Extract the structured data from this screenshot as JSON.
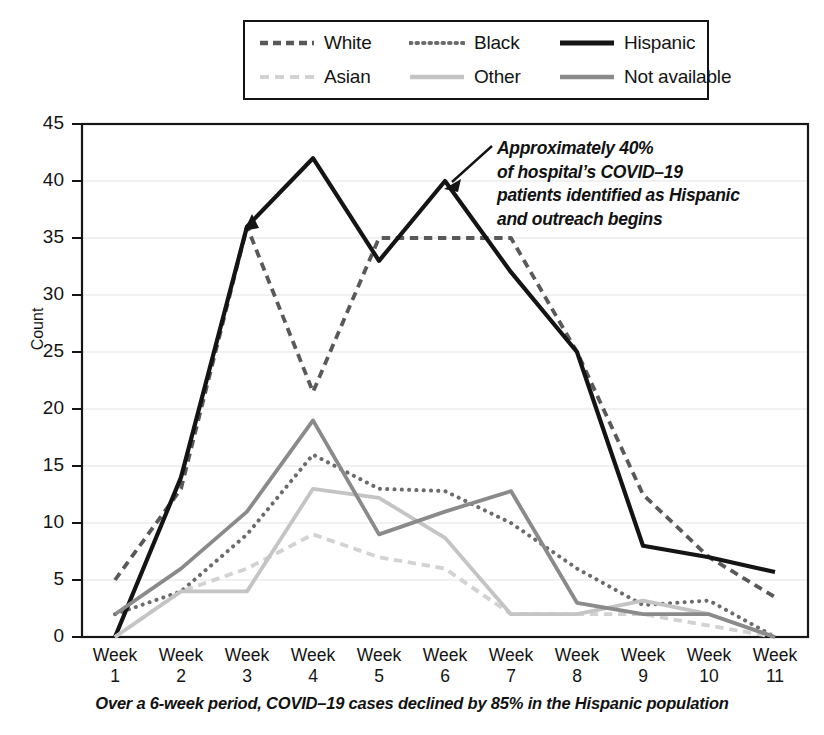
{
  "chart_data": {
    "type": "line",
    "title": "",
    "xlabel": "",
    "ylabel": "Count",
    "ylim": [
      0,
      45
    ],
    "yticks": [
      0,
      5,
      10,
      15,
      20,
      25,
      30,
      35,
      40,
      45
    ],
    "grid": true,
    "legend_position": "top",
    "categories": [
      "Week 1",
      "Week 2",
      "Week 3",
      "Week 4",
      "Week 5",
      "Week 6",
      "Week 7",
      "Week 8",
      "Week 9",
      "Week 10",
      "Week 11"
    ],
    "series": [
      {
        "name": "White",
        "style": "dashed",
        "color": "#595959",
        "values": [
          5,
          13,
          36,
          21.5,
          35,
          35,
          35,
          25,
          12.5,
          7,
          3.5
        ]
      },
      {
        "name": "Black",
        "style": "dotted",
        "color": "#6b6b6b",
        "values": [
          2,
          4,
          9,
          16,
          13,
          12.8,
          10,
          6,
          2.8,
          3.2,
          0
        ]
      },
      {
        "name": "Hispanic",
        "style": "solid",
        "color": "#141414",
        "values": [
          0,
          14,
          36,
          42,
          33,
          40,
          32,
          25,
          8,
          7,
          5.7
        ]
      },
      {
        "name": "Asian",
        "style": "dashed",
        "color": "#d2d2d2",
        "values": [
          0,
          4,
          6,
          9,
          7,
          6,
          2,
          2,
          2,
          1,
          0
        ]
      },
      {
        "name": "Other",
        "style": "solid",
        "color": "#c4c4c4",
        "values": [
          0,
          4,
          4,
          13,
          12.2,
          8.7,
          2,
          2,
          3.2,
          2,
          0
        ]
      },
      {
        "name": "Not available",
        "style": "solid",
        "color": "#8a8a8a",
        "values": [
          2,
          6,
          11,
          19,
          9,
          11,
          12.8,
          3,
          2,
          2,
          0
        ]
      }
    ],
    "annotations": [
      {
        "text_lines": [
          "Approximately 40%",
          "of hospital’s COVID–19",
          "patients identified as Hispanic",
          "and outreach begins"
        ],
        "points_to": {
          "series": "Hispanic",
          "category": "Week 6",
          "value": 40
        }
      }
    ],
    "caption": "Over a 6-week period, COVID–19 cases declined by 85% in the Hispanic population"
  },
  "legend": {
    "items": [
      {
        "label": "White"
      },
      {
        "label": "Black"
      },
      {
        "label": "Hispanic"
      },
      {
        "label": "Asian"
      },
      {
        "label": "Other"
      },
      {
        "label": "Not available"
      }
    ]
  },
  "axes": {
    "y_title": "Count",
    "y_ticks": [
      "45",
      "40",
      "35",
      "30",
      "25",
      "20",
      "15",
      "10",
      "5",
      "0"
    ],
    "x_ticks": [
      {
        "line1": "Week",
        "line2": "1"
      },
      {
        "line1": "Week",
        "line2": "2"
      },
      {
        "line1": "Week",
        "line2": "3"
      },
      {
        "line1": "Week",
        "line2": "4"
      },
      {
        "line1": "Week",
        "line2": "5"
      },
      {
        "line1": "Week",
        "line2": "6"
      },
      {
        "line1": "Week",
        "line2": "7"
      },
      {
        "line1": "Week",
        "line2": "8"
      },
      {
        "line1": "Week",
        "line2": "9"
      },
      {
        "line1": "Week",
        "line2": "10"
      },
      {
        "line1": "Week",
        "line2": "11"
      }
    ]
  },
  "annotation": {
    "line1": "Approximately 40%",
    "line2": "of hospital’s COVID–19",
    "line3": "patients identified as Hispanic",
    "line4": "and outreach begins"
  },
  "caption": {
    "text": "Over a 6-week period, COVID–19 cases declined by 85% in the Hispanic population"
  },
  "colors": {
    "white_series": "#595959",
    "black_series": "#6b6b6b",
    "hispanic_series": "#141414",
    "asian_series": "#d2d2d2",
    "other_series": "#c4c4c4",
    "not_available_series": "#8a8a8a",
    "frame": "#151515",
    "grid": "#e3e3e3"
  }
}
